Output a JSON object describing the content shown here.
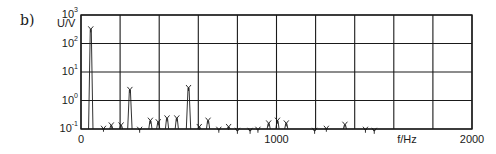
{
  "panel_label": "b)",
  "chart_data": {
    "type": "bar",
    "title": "",
    "xlabel": "f/Hz",
    "ylabel": "U/V",
    "xlim": [
      0,
      2000
    ],
    "ylim": [
      0.1,
      1000
    ],
    "yscale": "log",
    "grid": true,
    "legend": null,
    "x_ticks": [
      {
        "value": 0,
        "label": "0"
      },
      {
        "value": 1000,
        "label": "1000"
      },
      {
        "value": 2000,
        "label": "2000"
      }
    ],
    "y_ticks": [
      {
        "exp": "3",
        "base": "10",
        "value": 1000
      },
      {
        "exp": "2",
        "base": "10",
        "value": 100
      },
      {
        "exp": "1",
        "base": "10",
        "value": 10
      },
      {
        "exp": "0",
        "base": "10",
        "value": 1
      },
      {
        "exp": "-1",
        "base": "10",
        "value": 0.1
      }
    ],
    "x_gridlines": [
      0,
      200,
      400,
      600,
      800,
      1000,
      1200,
      1400,
      1600,
      1800,
      2000
    ],
    "peaks": [
      {
        "f": 50,
        "U": 400
      },
      {
        "f": 115,
        "U": 0.13
      },
      {
        "f": 155,
        "U": 0.17
      },
      {
        "f": 205,
        "U": 0.17
      },
      {
        "f": 250,
        "U": 3.0
      },
      {
        "f": 300,
        "U": 0.12
      },
      {
        "f": 355,
        "U": 0.25
      },
      {
        "f": 395,
        "U": 0.22
      },
      {
        "f": 440,
        "U": 0.3
      },
      {
        "f": 490,
        "U": 0.3
      },
      {
        "f": 550,
        "U": 3.5
      },
      {
        "f": 605,
        "U": 0.15
      },
      {
        "f": 650,
        "U": 0.25
      },
      {
        "f": 705,
        "U": 0.12
      },
      {
        "f": 755,
        "U": 0.15
      },
      {
        "f": 800,
        "U": 0.11
      },
      {
        "f": 865,
        "U": 0.11
      },
      {
        "f": 905,
        "U": 0.12
      },
      {
        "f": 960,
        "U": 0.2
      },
      {
        "f": 1005,
        "U": 0.25
      },
      {
        "f": 1050,
        "U": 0.2
      },
      {
        "f": 1195,
        "U": 0.11
      },
      {
        "f": 1255,
        "U": 0.13
      },
      {
        "f": 1350,
        "U": 0.18
      },
      {
        "f": 1455,
        "U": 0.12
      },
      {
        "f": 1500,
        "U": 0.11
      }
    ]
  },
  "colors": {
    "ink": "#1a1a1a",
    "background": "#ffffff"
  }
}
